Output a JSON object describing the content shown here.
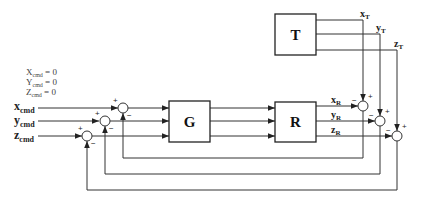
{
  "diagram": {
    "type": "block-diagram",
    "blocks": [
      {
        "id": "G",
        "label": "G"
      },
      {
        "id": "R",
        "label": "R"
      },
      {
        "id": "T",
        "label": "T"
      }
    ],
    "initial_conditions": [
      {
        "var": "X",
        "sub": "cmd",
        "rest": " = 0"
      },
      {
        "var": "Y",
        "sub": "cmd",
        "rest": " = 0"
      },
      {
        "var": "Z",
        "sub": "cmd",
        "rest": " = 0"
      }
    ],
    "inputs": [
      {
        "var": "x",
        "sub": "cmd"
      },
      {
        "var": "y",
        "sub": "cmd"
      },
      {
        "var": "z",
        "sub": "cmd"
      }
    ],
    "r_outputs": [
      {
        "var": "x",
        "sub": "R"
      },
      {
        "var": "y",
        "sub": "R"
      },
      {
        "var": "z",
        "sub": "R"
      }
    ],
    "t_outputs": [
      {
        "var": "x",
        "sub": "T"
      },
      {
        "var": "y",
        "sub": "T"
      },
      {
        "var": "z",
        "sub": "T"
      }
    ],
    "signs": {
      "plus": "+",
      "minus": "−"
    }
  }
}
